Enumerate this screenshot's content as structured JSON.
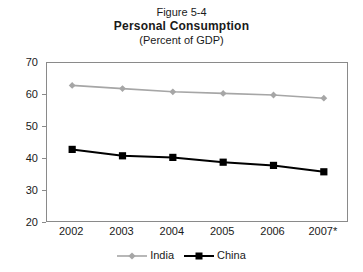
{
  "title": {
    "figure_number": "Figure 5-4",
    "main": "Personal Consumption",
    "subtitle": "(Percent of GDP)"
  },
  "axes": {
    "y_ticks": [
      "70",
      "60",
      "50",
      "40",
      "30",
      "20"
    ],
    "x_ticks": [
      "2002",
      "2003",
      "2004",
      "2005",
      "2006",
      "2007*"
    ]
  },
  "legend": {
    "items": [
      {
        "label": "India",
        "color": "#a6a6a6",
        "marker": "diamond-marker"
      },
      {
        "label": "China",
        "color": "#000000",
        "marker": "square-marker"
      }
    ]
  },
  "chart_data": {
    "type": "line",
    "title": "Personal Consumption",
    "subtitle": "(Percent of GDP)",
    "figure_number": "Figure 5-4",
    "xlabel": "",
    "ylabel": "",
    "categories": [
      "2002",
      "2003",
      "2004",
      "2005",
      "2006",
      "2007*"
    ],
    "ylim": [
      20,
      70
    ],
    "ytick_step": 10,
    "grid": false,
    "legend_position": "bottom-center",
    "series": [
      {
        "name": "India",
        "color": "#a6a6a6",
        "marker": "diamond",
        "values": [
          63,
          62,
          61,
          60.5,
          60,
          59
        ]
      },
      {
        "name": "China",
        "color": "#000000",
        "marker": "square",
        "values": [
          43,
          41,
          40.5,
          39,
          38,
          36
        ]
      }
    ]
  }
}
